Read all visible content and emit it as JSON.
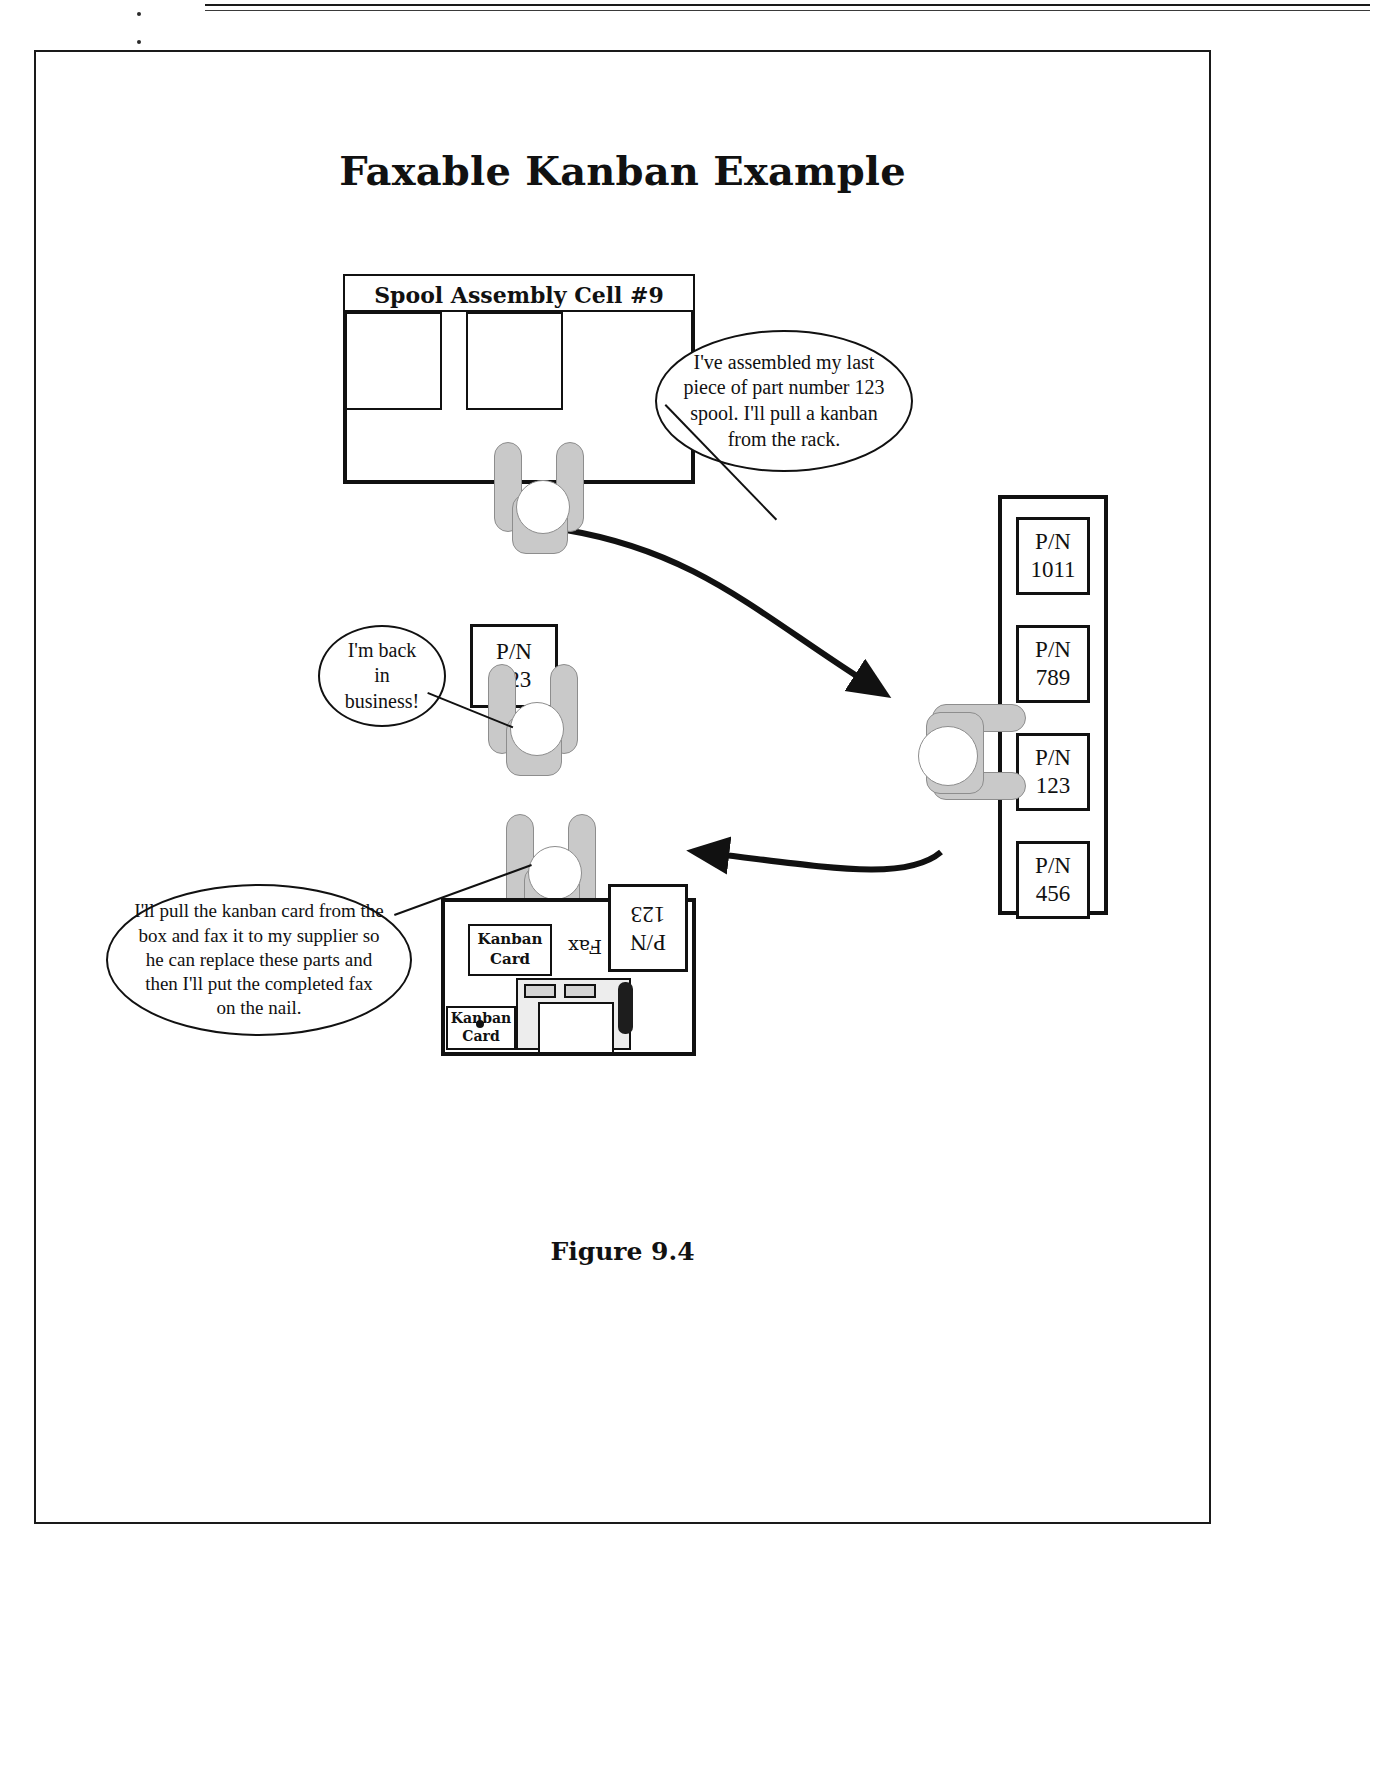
{
  "document": {
    "title": "Faxable Kanban Example",
    "figure_caption": "Figure 9.4"
  },
  "cell": {
    "header_label": "Spool Assembly Cell #9"
  },
  "speech_bubbles": [
    {
      "id": "operator-bubble",
      "text": "I've assembled my  last piece of part number 123 spool. I'll pull a kanban from the rack."
    },
    {
      "id": "back-in-business-bubble",
      "text": "I'm back in business!"
    },
    {
      "id": "fax-supplier-bubble",
      "text": "I'll pull the kanban card from the box and fax it to my supplier so he can replace these parts and then I'll put the completed fax on the nail."
    }
  ],
  "kanban_rack": {
    "slots": [
      {
        "prefix": "P/N",
        "number": "1011"
      },
      {
        "prefix": "P/N",
        "number": "789"
      },
      {
        "prefix": "P/N",
        "number": "456"
      }
    ],
    "pulled_card": {
      "prefix": "P/N",
      "number": "123"
    }
  },
  "carried_card": {
    "prefix": "P/N",
    "number": "123"
  },
  "fax_station": {
    "kanban_card_box_label": "Kanban\nCard",
    "kanban_card_box_line1": "Kanban",
    "kanban_card_box_line2": "Card",
    "nail_card_line1": "Kanban",
    "nail_card_line2": "Card",
    "fax_label": "Fax",
    "outgoing_card_prefix": "P/N",
    "outgoing_card_number": "123"
  },
  "colors": {
    "ink": "#111111",
    "person_fill": "#c9c9c9",
    "person_stroke": "#8d8d8d",
    "paper": "#ffffff"
  }
}
